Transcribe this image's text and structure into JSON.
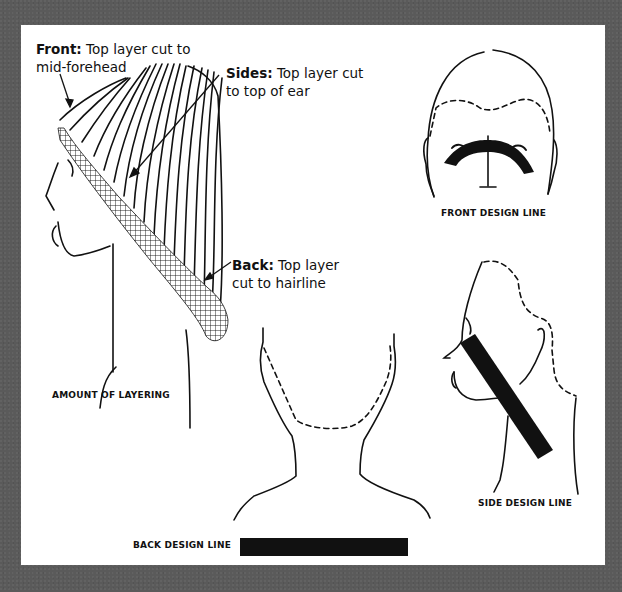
{
  "figure": {
    "panels": [
      {
        "id": "amount-of-layering",
        "caption": "AMOUNT OF LAYERING",
        "callouts": [
          {
            "key": "front",
            "title": "Front:",
            "text_line1": "Top layer cut to",
            "text_line2": "mid-forehead"
          },
          {
            "key": "sides",
            "title": "Sides:",
            "text_line1": "Top layer cut",
            "text_line2": "to top of ear"
          },
          {
            "key": "back",
            "title": "Back:",
            "text_line1": "Top layer",
            "text_line2": "cut to hairline"
          }
        ]
      },
      {
        "id": "front-design-line",
        "caption": "FRONT DESIGN LINE"
      },
      {
        "id": "side-design-line",
        "caption": "SIDE DESIGN LINE"
      },
      {
        "id": "back-design-line",
        "caption": "BACK DESIGN LINE"
      }
    ],
    "colors": {
      "background": "#5a5a5a",
      "panel": "#ffffff",
      "ink": "#111111"
    }
  }
}
